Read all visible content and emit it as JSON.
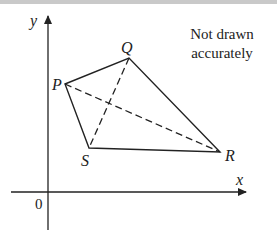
{
  "diagram": {
    "axes": {
      "x_label": "x",
      "y_label": "y",
      "origin_label": "0"
    },
    "note": {
      "line1": "Not drawn",
      "line2": "accurately"
    },
    "vertices": [
      {
        "name": "P",
        "label": "P"
      },
      {
        "name": "Q",
        "label": "Q"
      },
      {
        "name": "R",
        "label": "R"
      },
      {
        "name": "S",
        "label": "S"
      }
    ],
    "edges_solid": [
      "PQ",
      "QR",
      "RS",
      "SP"
    ],
    "diagonals_dashed": [
      "PR",
      "QS"
    ],
    "colors": {
      "line": "#222222",
      "top_bar": "#c9c9c9",
      "background": "#ffffff"
    }
  }
}
